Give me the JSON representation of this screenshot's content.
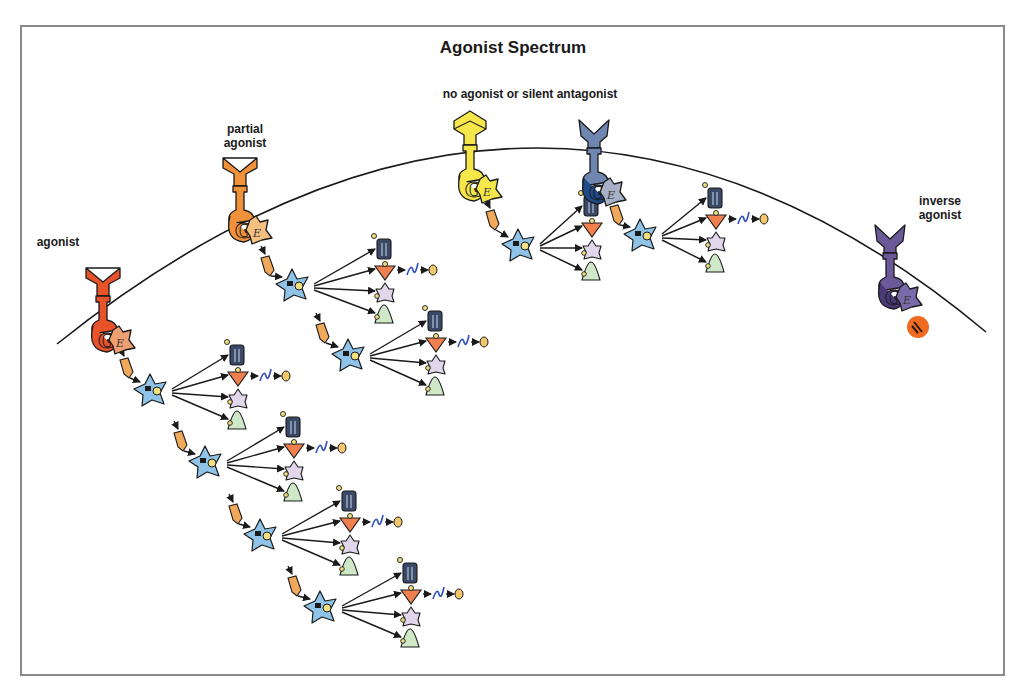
{
  "title": "Agonist Spectrum",
  "labels": {
    "agonist": "agonist",
    "partial_agonist": "partial\nagonist",
    "no_agonist": "no agonist or silent antagonist",
    "inverse_agonist": "inverse\nagonist"
  },
  "colors": {
    "frame": "#8a8a8a",
    "membrane": "#1a1a1a",
    "agonist": "#e8532a",
    "partial_agonist": "#f0923a",
    "no_agonist": "#f5e64a",
    "silent_antagonist": "#6f86b0",
    "inverse_agonist": "#6a5a9a",
    "inverse_marker": "#f06a20",
    "effector_star": "#8fc3e8",
    "bullet": "#f0a85a",
    "channel": "#3a4a66",
    "down_triangle": "#f08050",
    "lilac_star": "#e2d6ec",
    "green_cone": "#cfe8c8",
    "squiggle": "#3050c0",
    "oval": "#f2c66a"
  },
  "membrane_curve": {
    "start": [
      57,
      344
    ],
    "peak": [
      530,
      148
    ],
    "end": [
      986,
      332
    ]
  },
  "receptors": [
    {
      "name": "agonist",
      "x": 103,
      "y": 268,
      "color": "#e8532a",
      "g_color": "#e8532a",
      "e_color": "#f0a070",
      "ligand": "v-notch"
    },
    {
      "name": "partial-agonist",
      "x": 240,
      "y": 158,
      "color": "#f0923a",
      "g_color": "#f0923a",
      "e_color": "#f5c080",
      "ligand": "v-notch"
    },
    {
      "name": "no-agonist",
      "x": 470,
      "y": 117,
      "color": "#f5e64a",
      "g_color": "#f5e64a",
      "e_color": "#f5e64a",
      "ligand": "arrow-up"
    },
    {
      "name": "silent-antagonist",
      "x": 594,
      "y": 120,
      "color": "#6f86b0",
      "g_color": "#1f4a8a",
      "e_color": "#a8b0c8",
      "ligand": "y-fork"
    },
    {
      "name": "inverse-agonist",
      "x": 890,
      "y": 225,
      "color": "#6a5a9a",
      "g_color": "#4a3a7a",
      "e_color": "#7a6aaa",
      "ligand": "y-fork"
    }
  ],
  "cascades": [
    {
      "bullet": [
        124,
        360
      ],
      "star": [
        150,
        390
      ],
      "targets_x": 236,
      "top_y": 345,
      "full": true
    },
    {
      "bullet": [
        178,
        433
      ],
      "star": [
        205,
        462
      ],
      "targets_x": 292,
      "top_y": 417,
      "full": true
    },
    {
      "bullet": [
        233,
        506
      ],
      "star": [
        260,
        535
      ],
      "targets_x": 348,
      "top_y": 491,
      "full": true
    },
    {
      "bullet": [
        292,
        578
      ],
      "star": [
        320,
        607
      ],
      "targets_x": 409,
      "top_y": 563,
      "full": true
    },
    {
      "bullet": [
        265,
        258
      ],
      "star": [
        292,
        285
      ],
      "targets_x": 383,
      "top_y": 239,
      "full": true
    },
    {
      "bullet": [
        320,
        325
      ],
      "star": [
        348,
        355
      ],
      "targets_x": 434,
      "top_y": 311,
      "full": true
    },
    {
      "bullet": [
        490,
        212
      ],
      "star": [
        518,
        245
      ],
      "targets_x": 590,
      "top_y": 196,
      "full": false
    },
    {
      "bullet": [
        614,
        207
      ],
      "star": [
        640,
        235
      ],
      "targets_x": 714,
      "top_y": 188,
      "full": true
    }
  ],
  "inverse_marker": {
    "x": 918,
    "y": 327,
    "glyph": "N"
  }
}
